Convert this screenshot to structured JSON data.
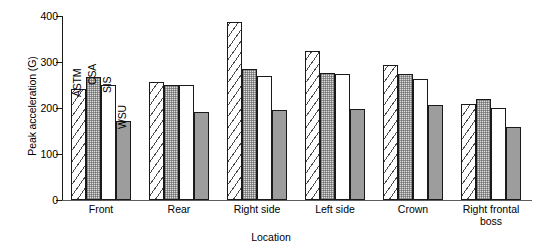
{
  "chart_data": {
    "type": "bar",
    "title": "",
    "xlabel": "Location",
    "ylabel": "Peak acceleration (G)",
    "categories": [
      "Front",
      "Rear",
      "Right side",
      "Left side",
      "Crown",
      "Right frontal boss"
    ],
    "series": [
      {
        "name": "ASTM",
        "values": [
          241,
          256,
          388,
          323,
          294,
          209
        ]
      },
      {
        "name": "CSA",
        "values": [
          268,
          251,
          285,
          276,
          273,
          220
        ]
      },
      {
        "name": "SIS",
        "values": [
          251,
          251,
          270,
          273,
          264,
          200
        ]
      },
      {
        "name": "WSU",
        "values": [
          171,
          192,
          195,
          197,
          207,
          158
        ]
      }
    ],
    "ylim": [
      0,
      400
    ],
    "yticks": [
      0,
      100,
      200,
      300,
      400
    ],
    "ytick_labels": [
      "0",
      "100",
      "200",
      "300",
      "400"
    ],
    "grid": false,
    "legend": "in-plot rotated labels above first group bars",
    "series_fill_patterns": [
      "diagonal-hatch",
      "stipple-light-gray",
      "white",
      "solid-gray"
    ]
  },
  "axis_colors": {
    "axis": "#1a1a1a",
    "baseline": "#5d5d5d",
    "bar_outline": "#1a1a1a",
    "csa_fill": "#dcdcdc",
    "wsu_fill": "#9d9d9d",
    "sis_fill": "#ffffff"
  }
}
